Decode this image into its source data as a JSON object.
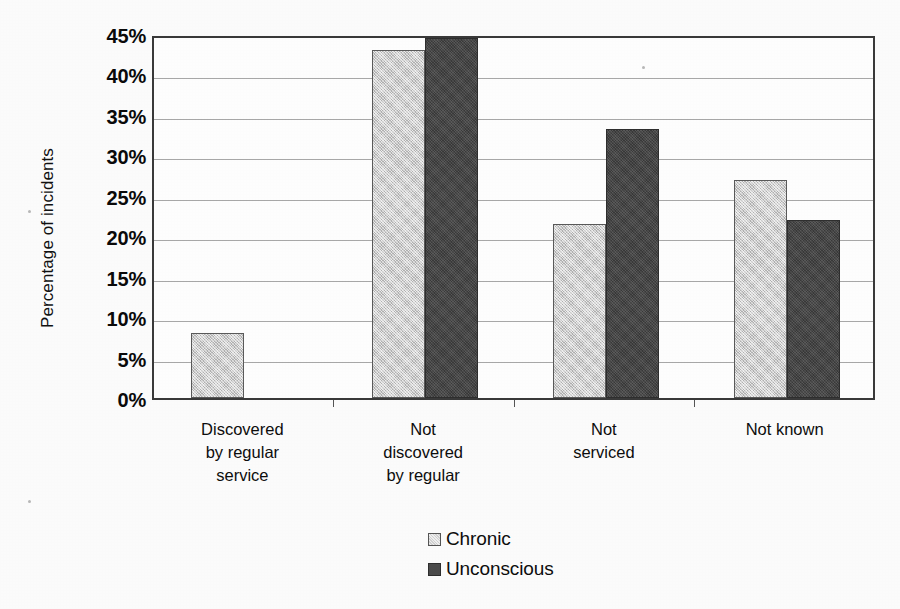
{
  "chart_data": {
    "type": "bar",
    "title": "",
    "xlabel": "",
    "ylabel": "Percentage of incidents",
    "ylim": [
      0,
      45
    ],
    "ytick_values": [
      0,
      5,
      10,
      15,
      20,
      25,
      30,
      35,
      40,
      45
    ],
    "ytick_labels": [
      "0%",
      "5%",
      "10%",
      "15%",
      "20%",
      "25%",
      "30%",
      "35%",
      "40%",
      "45%"
    ],
    "grid": true,
    "legend_position": "bottom-center",
    "categories": [
      "Discovered by regular service",
      "Not discovered by regular",
      "Not serviced",
      "Not known"
    ],
    "category_lines": [
      [
        "Discovered",
        "by regular",
        "service"
      ],
      [
        "Not",
        "discovered",
        "by regular"
      ],
      [
        "Not",
        "serviced"
      ],
      [
        "Not known"
      ]
    ],
    "series": [
      {
        "name": "Chronic",
        "color": "#cfcfcf",
        "values": [
          8.0,
          43.0,
          21.5,
          27.0
        ]
      },
      {
        "name": "Unconscious",
        "color": "#454545",
        "values": [
          null,
          44.5,
          33.3,
          22.0
        ]
      }
    ]
  },
  "legend": {
    "items": [
      {
        "label": "Chronic",
        "swatch": "light-gray-swatch"
      },
      {
        "label": "Unconscious",
        "swatch": "dark-gray-swatch"
      }
    ]
  }
}
